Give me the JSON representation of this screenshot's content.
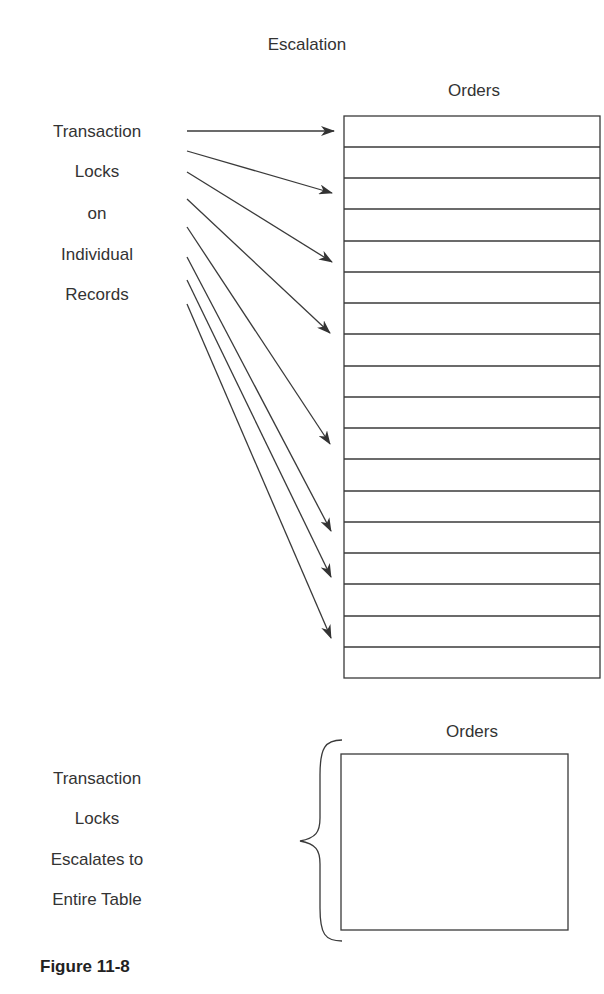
{
  "title": "Escalation",
  "top_section": {
    "table_label": "Orders",
    "left_label_lines": [
      "Transaction",
      "Locks",
      "on",
      "Individual",
      "Records"
    ],
    "row_count": 18,
    "arrows_count": 8
  },
  "bottom_section": {
    "table_label": "Orders",
    "left_label_lines": [
      "Transaction",
      "Locks",
      "Escalates to",
      "Entire Table"
    ]
  },
  "caption": "Figure 11-8",
  "colors": {
    "line": "#3a3a3a",
    "text": "#333333",
    "background": "#ffffff"
  }
}
